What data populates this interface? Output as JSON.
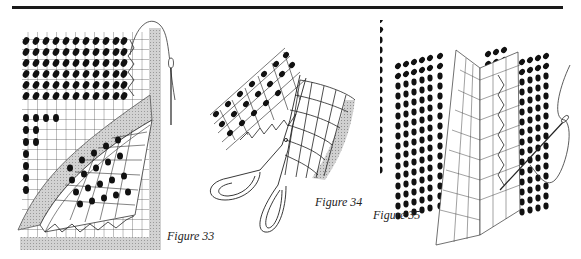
{
  "page": {
    "header_rule": true
  },
  "figures": [
    {
      "id": "figure-33",
      "caption": "Figure 33",
      "depicts": "canvas corner folded back over mesh with needle and thread"
    },
    {
      "id": "figure-34",
      "caption": "Figure 34",
      "depicts": "scissors trimming canvas edge"
    },
    {
      "id": "figure-35",
      "caption": "Figure 35",
      "depicts": "canvas pieces joined with needle and thread"
    }
  ],
  "colors": {
    "ink": "#111111",
    "grid": "#333333",
    "shade": "#bdbdbd"
  }
}
